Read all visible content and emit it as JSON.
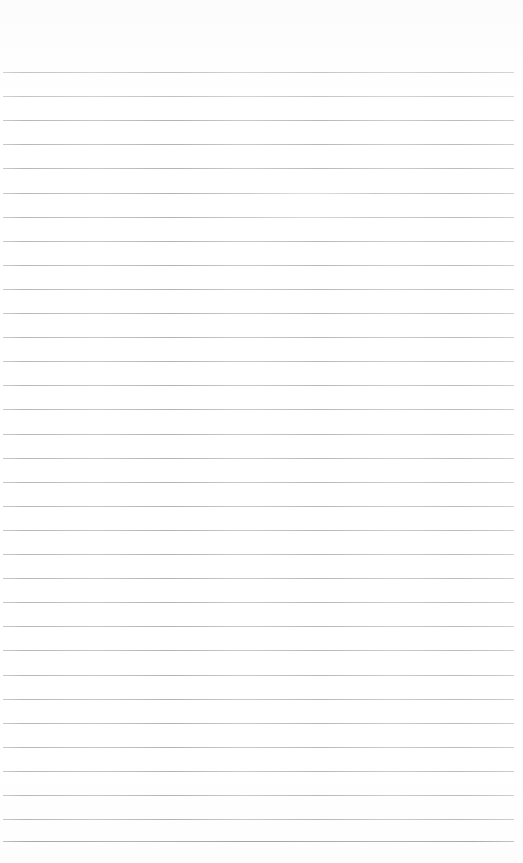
{
  "document": {
    "kind": "ruled-notebook-page",
    "page_width": 523,
    "page_height": 863,
    "background_color": "#ffffff",
    "text_content": "",
    "has_text": false,
    "has_handwriting": false,
    "has_header": false,
    "has_page_number": false,
    "margins": {
      "top": 72,
      "bottom": 20,
      "left": 3,
      "right": 9
    },
    "ruling": {
      "line_color": "#c9c9cd",
      "line_color_strong": "#b4b4ba",
      "line_thickness": 1,
      "line_spacing": 24.1,
      "first_line_y": 72,
      "last_line_y": 841,
      "line_start_x": 3,
      "line_end_x": 514,
      "line_count": 33,
      "line_y_positions": [
        72,
        96.1,
        120.2,
        144.3,
        168.4,
        192.5,
        216.6,
        240.7,
        264.8,
        288.9,
        313,
        337.1,
        361.2,
        385.3,
        409.4,
        433.5,
        457.6,
        481.7,
        505.8,
        529.9,
        554,
        578.1,
        602.2,
        626.3,
        650.4,
        674.5,
        698.6,
        722.7,
        746.8,
        770.9,
        795,
        819.1,
        841
      ],
      "strong_line_indices": [
        32
      ],
      "faint_line_indices": [
        0,
        1
      ]
    },
    "artifacts": [
      {
        "name": "scan-glare-highlight",
        "type": "highlight",
        "center_x": 312,
        "center_y": 205,
        "width": 120,
        "height": 26
      }
    ]
  }
}
